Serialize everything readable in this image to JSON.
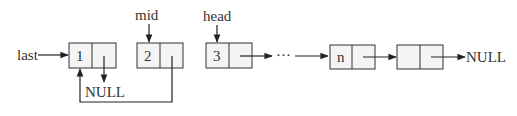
{
  "diagram": {
    "type": "linked-list",
    "colors": {
      "stroke": "#333333",
      "node_fill": "#f4f4f4",
      "text": "#333333",
      "label_text": "#555555"
    },
    "pointers": {
      "last": "last",
      "mid": "mid",
      "head": "head"
    },
    "nodes": [
      {
        "id": "n1",
        "value": "1"
      },
      {
        "id": "n2",
        "value": "2"
      },
      {
        "id": "n3",
        "value": "3"
      },
      {
        "id": "nn",
        "value": "n"
      },
      {
        "id": "n_last",
        "value": ""
      }
    ],
    "ellipsis": "···",
    "null_labels": {
      "n1_next": "NULL",
      "tail_next": "NULL"
    },
    "edges": [
      {
        "from": "last",
        "to": "n1"
      },
      {
        "from": "mid",
        "to": "n2"
      },
      {
        "from": "head",
        "to": "n3"
      },
      {
        "from": "n1.next",
        "to": "NULL"
      },
      {
        "from": "n2.next",
        "to": "n1"
      },
      {
        "from": "n3.next",
        "to": "..."
      },
      {
        "from": "...",
        "to": "nn"
      },
      {
        "from": "nn.next",
        "to": "n_last"
      },
      {
        "from": "n_last.next",
        "to": "NULL"
      }
    ]
  }
}
